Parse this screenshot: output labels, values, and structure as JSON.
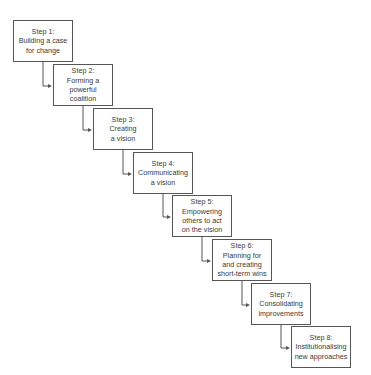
{
  "diagram": {
    "type": "staircase-flow",
    "colors": {
      "border": "#555555",
      "text": "#3a3a3a",
      "connector": "#555555",
      "background": "#ffffff"
    },
    "steps": [
      {
        "label": "Step 1:",
        "lines": [
          "Building a case",
          "for change"
        ],
        "x": 13,
        "y": 20
      },
      {
        "label": "Step 2:",
        "lines": [
          "Forming a",
          "powerful",
          "coalition"
        ],
        "x": 53,
        "y": 64
      },
      {
        "label": "Step 3:",
        "lines": [
          "Creating",
          "a vision"
        ],
        "x": 93,
        "y": 108
      },
      {
        "label": "Step 4:",
        "lines": [
          "Communicating",
          "a vision"
        ],
        "x": 133,
        "y": 152
      },
      {
        "label": "Step 5:",
        "lines": [
          "Empowering",
          "others to act",
          "on the vision"
        ],
        "x": 172,
        "y": 195
      },
      {
        "label": "Step 6:",
        "lines": [
          "Planning for",
          "and creating",
          "short-term wins"
        ],
        "x": 212,
        "y": 239
      },
      {
        "label": "Step 7:",
        "lines": [
          "Consolidating",
          "improvements"
        ],
        "x": 251,
        "y": 283
      },
      {
        "label": "Step 8:",
        "lines": [
          "Institutionalising",
          "new approaches"
        ],
        "x": 291,
        "y": 326
      }
    ]
  }
}
